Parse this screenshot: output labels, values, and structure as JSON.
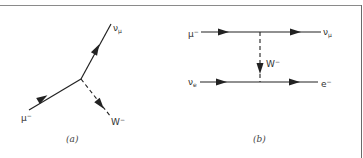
{
  "figure": {
    "panels": [
      {
        "id": "a",
        "caption": "(a)",
        "type": "vertex",
        "particles": {
          "incoming": {
            "base": "μ",
            "sup": "−",
            "sub": ""
          },
          "outgoing_fermion": {
            "base": "ν",
            "sub": "μ",
            "sup": ""
          },
          "outgoing_boson": {
            "base": "W",
            "sup": "−",
            "sub": ""
          }
        }
      },
      {
        "id": "b",
        "caption": "(b)",
        "type": "exchange",
        "particles": {
          "top_in": {
            "base": "μ",
            "sup": "−",
            "sub": ""
          },
          "top_out": {
            "base": "ν",
            "sub": "μ",
            "sup": ""
          },
          "exchange": {
            "base": "W",
            "sup": "−",
            "sub": ""
          },
          "bottom_in": {
            "base": "ν",
            "sub": "e",
            "sup": ""
          },
          "bottom_out": {
            "base": "e",
            "sup": "−",
            "sub": ""
          }
        }
      }
    ],
    "colors": {
      "line": "#222222",
      "frame": "#8a8a8a",
      "text": "#333333"
    }
  }
}
